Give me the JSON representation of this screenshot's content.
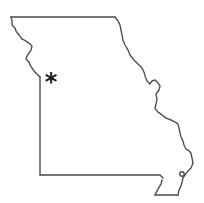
{
  "map": {
    "region": "Missouri",
    "style": "outline",
    "outline_color": "#4a4a4a",
    "background": "#ffffff",
    "marker": {
      "symbol": "*",
      "label": "location-marker",
      "color": "#1a1a1a"
    }
  }
}
